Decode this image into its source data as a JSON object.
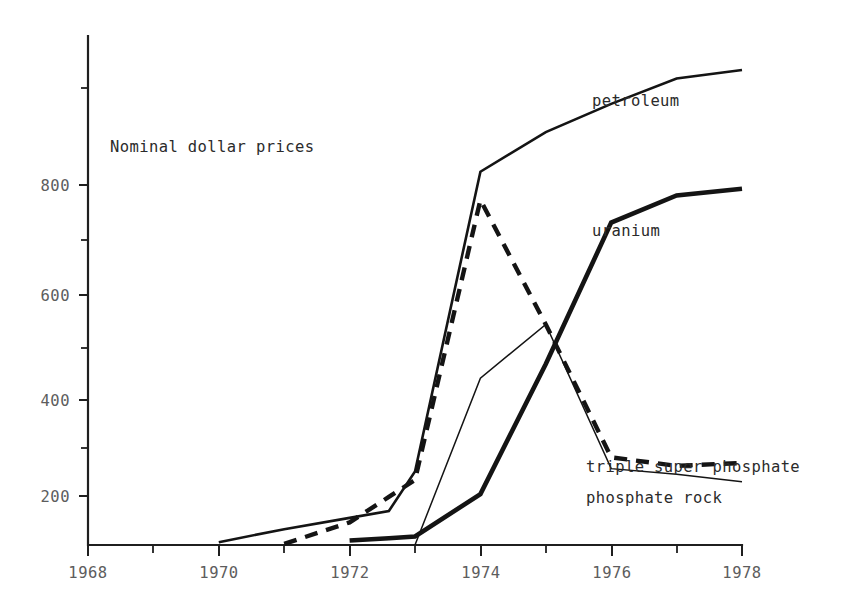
{
  "chart_data": {
    "type": "line",
    "title": "",
    "annotation": "Nominal dollar prices",
    "xlabel": "",
    "ylabel": "",
    "xlim": [
      1968,
      1978
    ],
    "ylim": [
      100,
      1000
    ],
    "grid": false,
    "legend_position": "right-inline-labels",
    "x_ticks_major": [
      1968,
      1970,
      1972,
      1974,
      1976,
      1978
    ],
    "x_ticks_minor": [
      1969,
      1971,
      1973,
      1975,
      1977
    ],
    "x_tick_labels": [
      "1968",
      "1970",
      "1972",
      "1974",
      "1976",
      "1978"
    ],
    "y_ticks_major": [
      200,
      400,
      600,
      800
    ],
    "y_ticks_minor": [
      300,
      500,
      700,
      900
    ],
    "y_tick_labels": [
      "200",
      "400",
      "600",
      "800"
    ],
    "series": [
      {
        "name": "petroleum",
        "label": "petroleum",
        "style": "thin-solid",
        "x": [
          1970,
          1971,
          1972,
          1972.6,
          1973,
          1974,
          1975,
          1976,
          1977,
          1978
        ],
        "values": [
          105,
          128,
          148,
          160,
          230,
          760,
          830,
          880,
          925,
          940
        ]
      },
      {
        "name": "uranium",
        "label": "uranium",
        "style": "thick-solid",
        "x": [
          1972,
          1972.6,
          1973,
          1974,
          1975,
          1976,
          1977,
          1978
        ],
        "values": [
          108,
          112,
          115,
          190,
          420,
          670,
          718,
          730
        ]
      },
      {
        "name": "triple super phosphate",
        "label": "triple super phosphate",
        "style": "thick-dashed",
        "x": [
          1971,
          1972,
          1972.6,
          1973,
          1974,
          1975,
          1976,
          1977,
          1978
        ],
        "values": [
          102,
          140,
          185,
          215,
          710,
          490,
          255,
          240,
          245
        ]
      },
      {
        "name": "phosphate rock",
        "label": "phosphate rock",
        "style": "thin-solid-light",
        "x": [
          1973,
          1974,
          1975,
          1976,
          1977,
          1978
        ],
        "values": [
          100,
          395,
          490,
          235,
          225,
          212
        ]
      }
    ]
  },
  "labels": {
    "annotation": "Nominal dollar prices",
    "petroleum": "petroleum",
    "uranium": "uranium",
    "triple_super_phosphate": "triple super phosphate",
    "phosphate_rock": "phosphate rock"
  },
  "axis": {
    "y_200": "200",
    "y_400": "400",
    "y_600": "600",
    "y_800": "800",
    "x_1968": "1968",
    "x_1970": "1970",
    "x_1972": "1972",
    "x_1974": "1974",
    "x_1976": "1976",
    "x_1978": "1978"
  },
  "colors": {
    "ink": "#141414",
    "tick_label": "#5d5d5d",
    "background": "#ffffff"
  }
}
